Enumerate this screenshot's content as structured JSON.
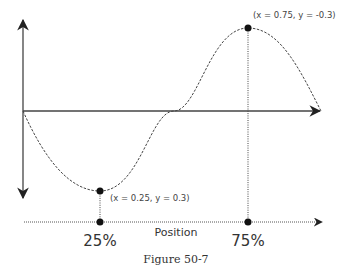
{
  "diagram": {
    "points": {
      "max_label": "(x = 0.75, y = -0.3)",
      "min_label": "(x = 0.25, y = 0.3)"
    },
    "ticks": {
      "left": "25%",
      "right": "75%"
    },
    "axis_title": "Position",
    "caption": "Figure 50-7",
    "colors": {
      "line": "#333333",
      "dot": "#111111"
    }
  }
}
